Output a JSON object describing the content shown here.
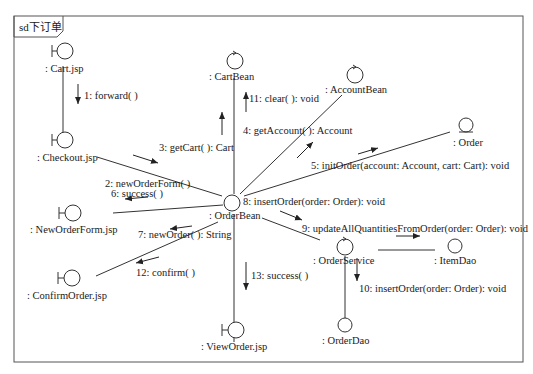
{
  "diagram": {
    "type": "UML communication diagram",
    "frame_title": "sd下订单",
    "colors": {
      "line": "#333333",
      "frame": "#555555",
      "background": "#ffffff"
    },
    "objects": [
      {
        "id": "cart_jsp",
        "label": ": Cart.jsp",
        "kind": "boundary"
      },
      {
        "id": "checkout_jsp",
        "label": ": Checkout.jsp",
        "kind": "boundary"
      },
      {
        "id": "new_order_form_jsp",
        "label": ": NewOrderForm.jsp",
        "kind": "boundary"
      },
      {
        "id": "confirm_order_jsp",
        "label": ": ConfirmOrder.jsp",
        "kind": "boundary"
      },
      {
        "id": "cart_bean",
        "label": ": CartBean",
        "kind": "control"
      },
      {
        "id": "account_bean",
        "label": ": AccountBean",
        "kind": "control"
      },
      {
        "id": "order",
        "label": ": Order",
        "kind": "entity"
      },
      {
        "id": "order_bean",
        "label": ": OrderBean",
        "kind": "control"
      },
      {
        "id": "order_service",
        "label": ": OrderService",
        "kind": "control"
      },
      {
        "id": "item_dao",
        "label": ": ItemDao",
        "kind": "entity-circle"
      },
      {
        "id": "order_dao",
        "label": ": OrderDao",
        "kind": "entity-circle"
      },
      {
        "id": "view_order_jsp",
        "label": ": ViewOrder.jsp",
        "kind": "boundary"
      }
    ],
    "messages": [
      {
        "n": 1,
        "label": "1: forward( )",
        "from": "cart_jsp",
        "to": "checkout_jsp"
      },
      {
        "n": 2,
        "label": "2: newOrderForm( )",
        "from": "checkout_jsp",
        "to": "order_bean"
      },
      {
        "n": 3,
        "label": "3: getCart( ): Cart",
        "from": "order_bean",
        "to": "cart_bean"
      },
      {
        "n": 4,
        "label": "4: getAccount( ): Account",
        "from": "order_bean",
        "to": "account_bean"
      },
      {
        "n": 5,
        "label": "5: initOrder(account: Account, cart: Cart): void",
        "from": "order_bean",
        "to": "order"
      },
      {
        "n": 6,
        "label": "6: success( )",
        "from": "order_bean",
        "to": "new_order_form_jsp"
      },
      {
        "n": 7,
        "label": "7: newOrder( ): String",
        "from": "new_order_form_jsp",
        "to": "order_bean"
      },
      {
        "n": 8,
        "label": "8: insertOrder(order: Order): void",
        "from": "order_bean",
        "to": "order_bean"
      },
      {
        "n": 9,
        "label": "9: updateAllQuantitiesFromOrder(order: Order): void",
        "from": "order_service",
        "to": "item_dao"
      },
      {
        "n": 10,
        "label": "10: insertOrder(order: Order): void",
        "from": "order_service",
        "to": "order_dao"
      },
      {
        "n": 11,
        "label": "11: clear( ): void",
        "from": "order_bean",
        "to": "cart_bean"
      },
      {
        "n": 12,
        "label": "12: confirm( )",
        "from": "order_bean",
        "to": "confirm_order_jsp"
      },
      {
        "n": 13,
        "label": "13: success( )",
        "from": "order_bean",
        "to": "view_order_jsp"
      }
    ]
  }
}
